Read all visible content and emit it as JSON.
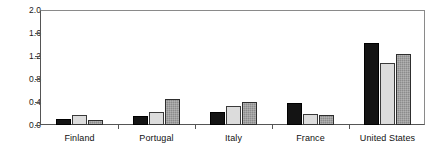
{
  "chart_data": {
    "type": "bar",
    "title": "",
    "subtitle": "",
    "xlabel": "",
    "ylabel": "",
    "categories": [
      "Finland",
      "Portugal",
      "Italy",
      "France",
      "United States"
    ],
    "series": [
      {
        "name": "series-1",
        "color": "#141414",
        "values": [
          0.1,
          0.15,
          0.22,
          0.38,
          1.42
        ]
      },
      {
        "name": "series-2",
        "color": "#dcdcdc",
        "values": [
          0.17,
          0.23,
          0.33,
          0.2,
          1.08
        ]
      },
      {
        "name": "series-3",
        "color": "#8c8c8c",
        "values": [
          0.08,
          0.45,
          0.4,
          0.18,
          1.23
        ]
      }
    ],
    "ylim": [
      0.0,
      2.0
    ],
    "ytick_labels": [
      "0.0",
      "0.4",
      "0.8",
      "1.2",
      "1.6",
      "2.0"
    ],
    "ytick_values": [
      0.0,
      0.4,
      0.8,
      1.2,
      1.6,
      2.0
    ],
    "grid": false,
    "legend": "none",
    "legend_position": "none"
  },
  "axis": {
    "y_labels": [
      "2.0",
      "1.6",
      "1.2",
      "0.8",
      "0.4",
      "0.0"
    ],
    "x_labels": [
      "Finland",
      "Portugal",
      "Italy",
      "France",
      "United States"
    ]
  }
}
